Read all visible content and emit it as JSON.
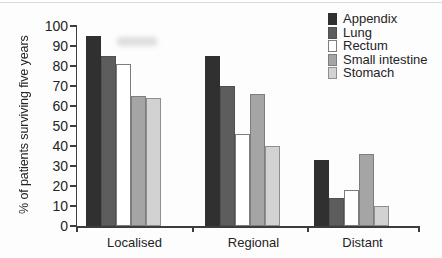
{
  "figure": {
    "background": "#fdfdfd",
    "text_color": "#242424",
    "axis_color": "#3c3c3c"
  },
  "chart_data": {
    "type": "bar",
    "title": "",
    "xlabel": "",
    "ylabel": "% of patients surviving five years",
    "ylim": [
      0,
      100
    ],
    "yticks": [
      0,
      10,
      20,
      30,
      40,
      50,
      60,
      70,
      80,
      90,
      100
    ],
    "grid": false,
    "legend_position": "top-right",
    "categories": [
      "Localised",
      "Regional",
      "Distant"
    ],
    "series": [
      {
        "name": "Appendix",
        "values": [
          95,
          85,
          33
        ],
        "fill": "#303030",
        "border": "#303030"
      },
      {
        "name": "Lung",
        "values": [
          85,
          70,
          14
        ],
        "fill": "#5d5d5d",
        "border": "#505050"
      },
      {
        "name": "Rectum",
        "values": [
          81,
          46,
          18
        ],
        "fill": "#ffffff",
        "border": "#7d7d7d"
      },
      {
        "name": "Small intestine",
        "values": [
          65,
          66,
          36
        ],
        "fill": "#a5a5a5",
        "border": "#7d7d7d"
      },
      {
        "name": "Stomach",
        "values": [
          64,
          40,
          10
        ],
        "fill": "#d2d2d2",
        "border": "#8f8f8f"
      }
    ]
  }
}
